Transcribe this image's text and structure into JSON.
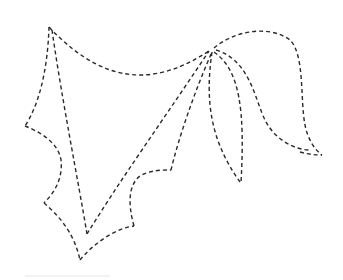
{
  "drawing": {
    "description": "dashed-line sketch of a wing/leaf shape with curling tendrils",
    "stroke_color": "#2a2a2a",
    "background": "#ffffff",
    "anchors": {
      "apex": [
        49,
        27
      ],
      "hub": [
        209,
        51
      ],
      "left_notch": [
        25,
        126
      ],
      "bottom_tip": [
        80,
        260
      ],
      "inner_v": [
        87,
        234
      ],
      "lower_notch": [
        134,
        218
      ],
      "inner_corner": [
        171,
        171
      ]
    }
  }
}
